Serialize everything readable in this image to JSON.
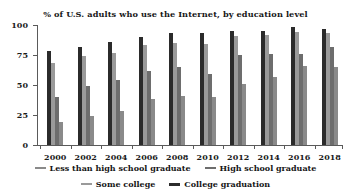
{
  "chart_data": {
    "type": "bar",
    "title": "% of U.S. adults who use the Internet, by education level",
    "xlabel": "",
    "ylabel": "",
    "ylim": [
      0,
      100
    ],
    "yticks": [
      0,
      25,
      50,
      75,
      100
    ],
    "grid": false,
    "legend_position": "bottom",
    "categories": [
      "2000",
      "2002",
      "2004",
      "2006",
      "2008",
      "2010",
      "2012",
      "2014",
      "2016",
      "2018"
    ],
    "series": [
      {
        "name": "College graduation",
        "color": "#2b2b2b",
        "values": [
          78,
          82,
          86,
          90,
          93,
          93,
          95,
          95,
          98,
          97
        ]
      },
      {
        "name": "Some college",
        "color": "#9a9a9a",
        "values": [
          68,
          74,
          77,
          83,
          85,
          84,
          91,
          92,
          94,
          93
        ]
      },
      {
        "name": "High school graduate",
        "color": "#6d6d6d",
        "values": [
          40,
          49,
          54,
          62,
          65,
          59,
          75,
          76,
          76,
          82
        ]
      },
      {
        "name": "Less than high school graduate",
        "color": "#8a8a8a",
        "values": [
          19,
          24,
          28,
          38,
          41,
          40,
          51,
          57,
          66,
          65
        ]
      }
    ],
    "legend_rows": [
      [
        "Less than high school graduate",
        "High school graduate"
      ],
      [
        "Some college",
        "College graduation"
      ]
    ]
  }
}
